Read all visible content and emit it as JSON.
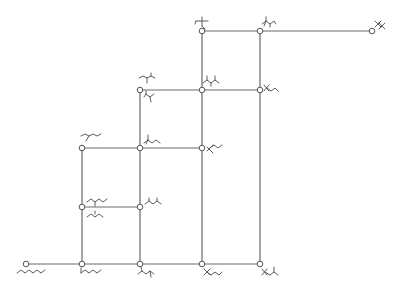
{
  "diagram": {
    "type": "lattice-graph",
    "colors": {
      "edge": "#6a6a6a",
      "node_stroke": "#555555",
      "node_fill": "#ffffff",
      "glyph": "#4a4a4a",
      "background": "#ffffff"
    },
    "nodes": [
      {
        "id": "n1",
        "x": 26,
        "y": 264,
        "glyph": "linear-chain-long",
        "label_pos": "below"
      },
      {
        "id": "n2",
        "x": 82,
        "y": 264,
        "glyph": "branched-2-methyl-chain",
        "label_pos": "below"
      },
      {
        "id": "n3",
        "x": 140,
        "y": 264,
        "glyph": "branched-dimethyl-chain",
        "label_pos": "below"
      },
      {
        "id": "n4",
        "x": 202,
        "y": 264,
        "glyph": "gem-dimethyl-chain",
        "label_pos": "below"
      },
      {
        "id": "n5",
        "x": 260,
        "y": 264,
        "glyph": "gem-dimethyl-isopropyl",
        "label_pos": "below"
      },
      {
        "id": "n6",
        "x": 82,
        "y": 207,
        "glyph": "methyl-chain-pair",
        "label_pos": "right"
      },
      {
        "id": "n7",
        "x": 140,
        "y": 207,
        "glyph": "dimethyl-chain",
        "label_pos": "right"
      },
      {
        "id": "n8",
        "x": 82,
        "y": 148,
        "glyph": "ethyl-branched-chain",
        "label_pos": "above"
      },
      {
        "id": "n9",
        "x": 140,
        "y": 148,
        "glyph": "methyl-ethyl-chain",
        "label_pos": "above-right"
      },
      {
        "id": "n10",
        "x": 202,
        "y": 148,
        "glyph": "gem-dimethyl-long",
        "label_pos": "right"
      },
      {
        "id": "n11",
        "x": 140,
        "y": 90,
        "glyph": "ethyl-methyl-pair",
        "label_pos": "above-below"
      },
      {
        "id": "n12",
        "x": 202,
        "y": 90,
        "glyph": "trimethyl-chain",
        "label_pos": "above"
      },
      {
        "id": "n13",
        "x": 260,
        "y": 90,
        "glyph": "gem-dimethyl-propyl",
        "label_pos": "right"
      },
      {
        "id": "n14",
        "x": 202,
        "y": 31,
        "glyph": "tert-butyl-ethyl",
        "label_pos": "above"
      },
      {
        "id": "n15",
        "x": 260,
        "y": 31,
        "glyph": "gem-dimethyl-isopropyl-2",
        "label_pos": "above"
      },
      {
        "id": "n16",
        "x": 372,
        "y": 31,
        "glyph": "tetramethyl",
        "label_pos": "above-right"
      }
    ],
    "edges": [
      [
        "n1",
        "n2"
      ],
      [
        "n2",
        "n3"
      ],
      [
        "n3",
        "n4"
      ],
      [
        "n4",
        "n5"
      ],
      [
        "n2",
        "n6"
      ],
      [
        "n6",
        "n7"
      ],
      [
        "n3",
        "n7"
      ],
      [
        "n6",
        "n8"
      ],
      [
        "n8",
        "n9"
      ],
      [
        "n7",
        "n9"
      ],
      [
        "n9",
        "n10"
      ],
      [
        "n4",
        "n10"
      ],
      [
        "n9",
        "n11"
      ],
      [
        "n11",
        "n12"
      ],
      [
        "n10",
        "n12"
      ],
      [
        "n12",
        "n13"
      ],
      [
        "n5",
        "n13"
      ],
      [
        "n12",
        "n14"
      ],
      [
        "n14",
        "n15"
      ],
      [
        "n13",
        "n15"
      ],
      [
        "n15",
        "n16"
      ]
    ]
  }
}
